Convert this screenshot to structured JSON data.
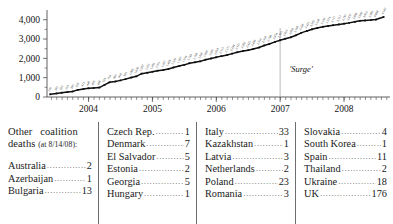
{
  "chart_data": {
    "type": "line",
    "title": "",
    "xlabel": "",
    "ylabel": "",
    "ylim": [
      0,
      4400
    ],
    "yticks": [
      "0",
      "1,000",
      "2,000",
      "3,000",
      "4,000"
    ],
    "ytick_values": [
      0,
      1000,
      2000,
      3000,
      4000
    ],
    "xticks": [
      "2004",
      "2005",
      "2006",
      "2007",
      "2008"
    ],
    "xtick_values": [
      2004,
      2005,
      2006,
      2007,
      2008
    ],
    "xlim": [
      2003.35,
      2008.72
    ],
    "grid": false,
    "legend": "none",
    "annotations": [
      {
        "text": "'Surge'",
        "x": 2007.0,
        "note": "vertical reference line at start of 2007"
      }
    ],
    "series": [
      {
        "name": "Cumulative U.S. military deaths in Iraq",
        "x": [
          2003.4,
          2003.5,
          2003.58,
          2003.67,
          2003.75,
          2003.83,
          2003.92,
          2004.0,
          2004.08,
          2004.17,
          2004.25,
          2004.33,
          2004.42,
          2004.5,
          2004.58,
          2004.67,
          2004.75,
          2004.83,
          2004.92,
          2005.0,
          2005.08,
          2005.17,
          2005.25,
          2005.33,
          2005.42,
          2005.5,
          2005.58,
          2005.67,
          2005.75,
          2005.83,
          2005.92,
          2006.0,
          2006.08,
          2006.17,
          2006.25,
          2006.33,
          2006.42,
          2006.5,
          2006.58,
          2006.67,
          2006.75,
          2006.83,
          2006.92,
          2007.0,
          2007.08,
          2007.17,
          2007.25,
          2007.33,
          2007.42,
          2007.5,
          2007.58,
          2007.67,
          2007.75,
          2007.83,
          2007.92,
          2008.0,
          2008.08,
          2008.17,
          2008.25,
          2008.33,
          2008.42,
          2008.5,
          2008.62
        ],
        "values": [
          139,
          186,
          222,
          253,
          286,
          368,
          413,
          448,
          468,
          488,
          624,
          764,
          806,
          860,
          926,
          1006,
          1070,
          1207,
          1255,
          1303,
          1361,
          1397,
          1449,
          1529,
          1607,
          1664,
          1749,
          1798,
          1845,
          1930,
          1996,
          2058,
          2115,
          2171,
          2244,
          2321,
          2382,
          2425,
          2490,
          2562,
          2668,
          2740,
          2854,
          2936,
          3013,
          3094,
          3198,
          3320,
          3421,
          3503,
          3568,
          3633,
          3674,
          3717,
          3757,
          3797,
          3837,
          3890,
          3942,
          3963,
          3983,
          4008,
          4142
        ],
        "final_value": 4142
      }
    ]
  },
  "table": {
    "header": {
      "line1": "Other coalition",
      "line2": "deaths",
      "line2_date": "(at 8/14/08):"
    },
    "columns": [
      {
        "entries": [
          {
            "name": "Australia",
            "value": "2"
          },
          {
            "name": "Azerbaijan",
            "value": "1"
          },
          {
            "name": "Bulgaria",
            "value": "13"
          }
        ]
      },
      {
        "entries": [
          {
            "name": "Czech Rep.",
            "value": "1"
          },
          {
            "name": "Denmark",
            "value": "7"
          },
          {
            "name": "El Salvador",
            "value": "5"
          },
          {
            "name": "Estonia",
            "value": "2"
          },
          {
            "name": "Georgia",
            "value": "5"
          },
          {
            "name": "Hungary",
            "value": "1"
          }
        ]
      },
      {
        "entries": [
          {
            "name": "Italy",
            "value": "33"
          },
          {
            "name": "Kazakhstan",
            "value": "1"
          },
          {
            "name": "Latvia",
            "value": "3"
          },
          {
            "name": "Netherlands",
            "value": "2"
          },
          {
            "name": "Poland",
            "value": "23"
          },
          {
            "name": "Romania",
            "value": "3"
          }
        ]
      },
      {
        "entries": [
          {
            "name": "Slovakia",
            "value": "4"
          },
          {
            "name": "South Korea",
            "value": "1"
          },
          {
            "name": "Spain",
            "value": "11"
          },
          {
            "name": "Thailand",
            "value": "2"
          },
          {
            "name": "Ukraine",
            "value": "18"
          },
          {
            "name": "UK",
            "value": "176"
          }
        ]
      }
    ]
  },
  "colors": {
    "series": "#0f0f0f",
    "axis": "#3a3a3a",
    "surge_line": "#9a9a9a",
    "text": "#1a1a1a",
    "background": "#ffffff"
  }
}
